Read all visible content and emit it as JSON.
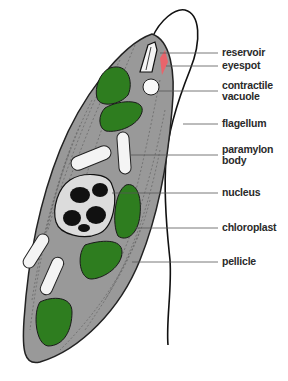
{
  "colors": {
    "body": "#999999",
    "body_outline": "#222222",
    "chloroplast": "#2e7d1f",
    "eyespot": "#e8646b",
    "paramylon": "#f4f4f4",
    "nucleus": "#111111",
    "leader_line": "#555555"
  },
  "labels": [
    {
      "id": "reservoir",
      "text": "reservoir"
    },
    {
      "id": "eyespot",
      "text": "eyespot"
    },
    {
      "id": "contractile-vacuole",
      "text": "contractile\nvacuole"
    },
    {
      "id": "flagellum",
      "text": "flagellum"
    },
    {
      "id": "paramylon-body",
      "text": "paramylon\nbody"
    },
    {
      "id": "nucleus",
      "text": "nucleus"
    },
    {
      "id": "chloroplast",
      "text": "chloroplast"
    },
    {
      "id": "pellicle",
      "text": "pellicle"
    }
  ]
}
